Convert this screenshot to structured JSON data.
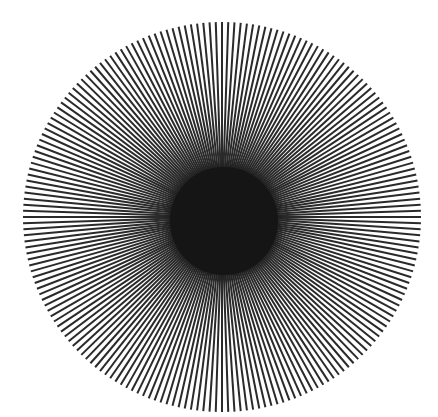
{
  "figure": {
    "center": {
      "x": 222,
      "y": 217
    },
    "outer_radius_x": 199,
    "outer_radius_y": 195,
    "inner_disc_radius": 56,
    "line_count": 200,
    "colors": {
      "background": "#ffffff",
      "line": "#2a2a2a",
      "center": "#151515"
    }
  }
}
